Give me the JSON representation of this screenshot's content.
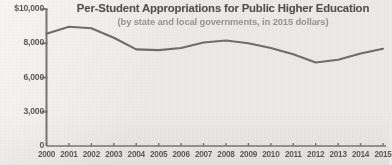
{
  "chart_data": {
    "type": "line",
    "title": "Per-Student Appropriations for Public Higher Education",
    "subtitle": "(by state and local governments, in 2015 dollars)",
    "xlabel": "",
    "ylabel": "",
    "grid": false,
    "legend": "none",
    "categories": [
      "2000",
      "2001",
      "2002",
      "2003",
      "2004",
      "2005",
      "2006",
      "2007",
      "2008",
      "2009",
      "2010",
      "2011",
      "2012",
      "2013",
      "2014",
      "2015"
    ],
    "values": [
      8200,
      8700,
      8600,
      7900,
      7050,
      7000,
      7150,
      7550,
      7700,
      7500,
      7150,
      6700,
      6100,
      6300,
      6750,
      7100
    ],
    "y_tick_labels": [
      "$10,000",
      "8,000",
      "6,000",
      "3,000",
      "0"
    ],
    "y_tick_values": [
      10000,
      8000,
      6000,
      3000,
      0
    ],
    "ylim": [
      0,
      10000
    ],
    "series_name": "Per-student appropriations",
    "line_color": "#6e6d69",
    "axis_color": "#76756f",
    "text_color": "#53524e",
    "subtitle_color": "#96948e",
    "background_color": "#ebeae7"
  }
}
